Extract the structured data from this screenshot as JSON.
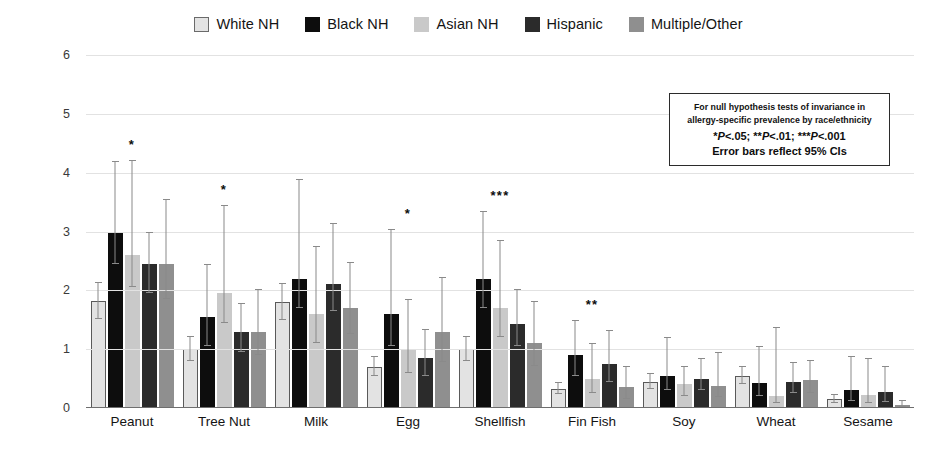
{
  "chart_data": {
    "type": "bar",
    "title": "",
    "xlabel": "",
    "ylabel": "% of US Pediatric Population",
    "ylim": [
      0,
      6
    ],
    "yticks": [
      0,
      1,
      2,
      3,
      4,
      5,
      6
    ],
    "grid": true,
    "legend_position": "top-center",
    "categories": [
      "Peanut",
      "Tree Nut",
      "Milk",
      "Egg",
      "Shellfish",
      "Fin Fish",
      "Soy",
      "Wheat",
      "Sesame"
    ],
    "series": [
      {
        "name": "White NH",
        "color": "#e3e3e3",
        "border": "#5a5a5a",
        "values": [
          1.82,
          1.0,
          1.8,
          0.7,
          1.0,
          0.33,
          0.45,
          0.55,
          0.15
        ],
        "ci_low": [
          1.52,
          0.8,
          1.5,
          0.55,
          0.8,
          0.23,
          0.32,
          0.4,
          0.08
        ],
        "ci_high": [
          2.15,
          1.22,
          2.12,
          0.88,
          1.22,
          0.45,
          0.6,
          0.72,
          0.24
        ]
      },
      {
        "name": "Black NH",
        "color": "#0d0d0d",
        "border": "#0d0d0d",
        "values": [
          3.0,
          1.55,
          2.2,
          1.6,
          2.2,
          0.9,
          0.55,
          0.42,
          0.3
        ],
        "ci_low": [
          2.45,
          1.05,
          1.7,
          1.05,
          1.7,
          0.55,
          0.3,
          0.2,
          0.12
        ],
        "ci_high": [
          4.2,
          2.45,
          3.9,
          3.05,
          3.35,
          1.5,
          1.2,
          1.05,
          0.88
        ]
      },
      {
        "name": "Asian NH",
        "color": "#c9c9c9",
        "border": "#c9c9c9",
        "values": [
          2.6,
          1.95,
          1.6,
          1.0,
          1.7,
          0.5,
          0.4,
          0.2,
          0.22
        ],
        "ci_low": [
          2.05,
          1.45,
          1.1,
          0.6,
          1.2,
          0.25,
          0.2,
          0.08,
          0.08
        ],
        "ci_high": [
          4.22,
          3.45,
          2.75,
          1.85,
          2.85,
          1.1,
          0.72,
          1.38,
          0.85
        ]
      },
      {
        "name": "Hispanic",
        "color": "#2b2b2b",
        "border": "#2b2b2b",
        "values": [
          2.45,
          1.3,
          2.1,
          0.85,
          1.42,
          0.75,
          0.5,
          0.45,
          0.28
        ],
        "ci_low": [
          1.95,
          0.95,
          1.65,
          0.55,
          1.05,
          0.45,
          0.3,
          0.25,
          0.1
        ],
        "ci_high": [
          3.0,
          1.78,
          3.15,
          1.35,
          2.02,
          1.32,
          0.85,
          0.78,
          0.72
        ]
      },
      {
        "name": "Multiple/Other",
        "color": "#8f8f8f",
        "border": "#8f8f8f",
        "values": [
          2.45,
          1.3,
          1.7,
          1.3,
          1.1,
          0.35,
          0.37,
          0.47,
          0.05
        ],
        "ci_low": [
          1.85,
          0.9,
          1.25,
          0.78,
          0.72,
          0.15,
          0.18,
          0.25,
          0.02
        ],
        "ci_high": [
          3.55,
          2.02,
          2.48,
          2.22,
          1.82,
          0.72,
          0.95,
          0.82,
          0.14
        ]
      }
    ],
    "significance": [
      {
        "category": "Peanut",
        "marker": "*"
      },
      {
        "category": "Tree Nut",
        "marker": "*"
      },
      {
        "category": "Milk",
        "marker": ""
      },
      {
        "category": "Egg",
        "marker": "*"
      },
      {
        "category": "Shellfish",
        "marker": "***"
      },
      {
        "category": "Fin Fish",
        "marker": "**"
      },
      {
        "category": "Soy",
        "marker": ""
      },
      {
        "category": "Wheat",
        "marker": ""
      },
      {
        "category": "Sesame",
        "marker": ""
      }
    ],
    "annotation_box": {
      "line1": "For null hypothesis tests of invariance in",
      "line2": "allergy-specific prevalence by race/ethnicity",
      "line3": "*P<.05; **P<.01; ***P<.001",
      "line4": "Error bars reflect 95% CIs"
    }
  },
  "legend": {
    "items": [
      {
        "label": "White NH",
        "swatch": "legend-swatch-white-nh"
      },
      {
        "label": "Black NH",
        "swatch": "legend-swatch-black-nh"
      },
      {
        "label": "Asian NH",
        "swatch": "legend-swatch-asian-nh"
      },
      {
        "label": "Hispanic",
        "swatch": "legend-swatch-hispanic"
      },
      {
        "label": "Multiple/Other",
        "swatch": "legend-swatch-multiple-other"
      }
    ]
  }
}
